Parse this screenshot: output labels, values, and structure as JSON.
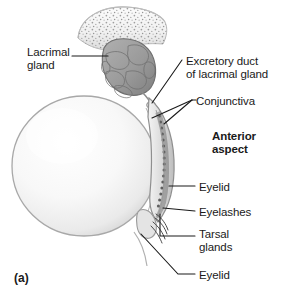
{
  "figure": {
    "marker": "(a)",
    "colors": {
      "background": "#ffffff",
      "eyeball_fill": "#f7f7f7",
      "eyeball_outline": "#9b9b9b",
      "gland_fill": "#9a9a9a",
      "gland_outline": "#6e6e6e",
      "bone_fill": "#f2f2f2",
      "bone_speckle": "#8a8a8a",
      "eyelid_fill": "#d8d8d8",
      "tarsal_gland": "#6b6b6b",
      "leader_line": "#1a1a1a",
      "text": "#1a1a1a"
    }
  },
  "labels": [
    {
      "id": "lacrimal-gland",
      "text": "Lacrimal\ngland",
      "bold": false,
      "x": 27,
      "y": 46
    },
    {
      "id": "excretory-duct",
      "text": "Excretory duct\nof lacrimal gland",
      "bold": false,
      "x": 186,
      "y": 55
    },
    {
      "id": "conjunctiva",
      "text": "Conjunctiva",
      "bold": false,
      "x": 196,
      "y": 95
    },
    {
      "id": "anterior-aspect",
      "text": "Anterior\naspect",
      "bold": true,
      "x": 212,
      "y": 130
    },
    {
      "id": "eyelid-upper",
      "text": "Eyelid",
      "bold": false,
      "x": 199,
      "y": 181
    },
    {
      "id": "eyelashes",
      "text": "Eyelashes",
      "bold": false,
      "x": 199,
      "y": 206
    },
    {
      "id": "tarsal-glands",
      "text": "Tarsal\nglands",
      "bold": false,
      "x": 199,
      "y": 228
    },
    {
      "id": "eyelid-lower",
      "text": "Eyelid",
      "bold": false,
      "x": 199,
      "y": 269
    }
  ],
  "structures": [
    {
      "id": "orbital-bone",
      "name": "Orbital bone (spongy bone)"
    },
    {
      "id": "lacrimal-gland-body",
      "name": "Lacrimal gland"
    },
    {
      "id": "excretory-duct-opening",
      "name": "Excretory duct opening"
    },
    {
      "id": "eyeball",
      "name": "Eyeball"
    },
    {
      "id": "conjunctiva-membrane",
      "name": "Conjunctiva"
    },
    {
      "id": "upper-eyelid",
      "name": "Upper eyelid"
    },
    {
      "id": "tarsal-gland-column",
      "name": "Tarsal glands"
    },
    {
      "id": "eyelashes-tuft",
      "name": "Eyelashes"
    },
    {
      "id": "lower-eyelid",
      "name": "Lower eyelid"
    }
  ]
}
